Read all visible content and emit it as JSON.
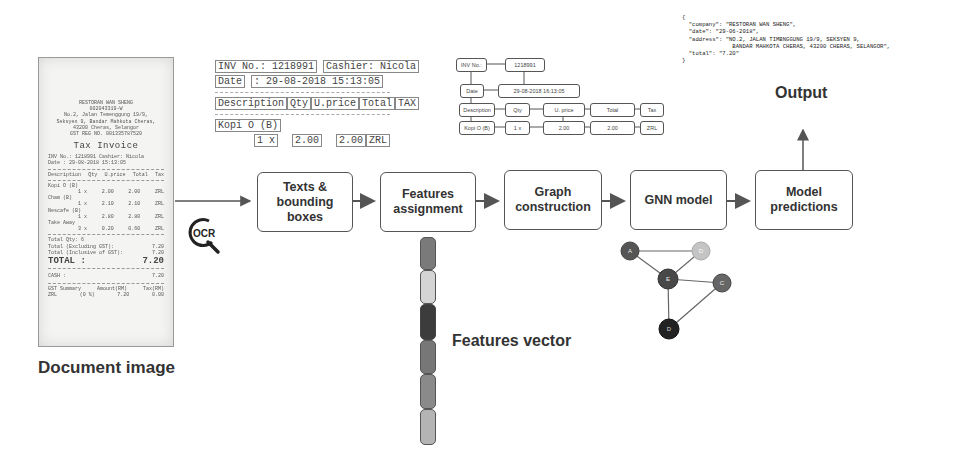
{
  "document": {
    "label": "Document image",
    "receipt": {
      "header_lines": [
        "RESTORAN WAN SHENG",
        "002043319-W",
        "No.2, Jalan Temenggung 19/9,",
        "Seksyen 9, Bandar Mahkota Cheras,",
        "43200 Cheras, Selangor",
        "GST REG NO. 001335787520"
      ],
      "title": "Tax Invoice",
      "inv_line": "INV No.: 1218991   Cashier: Nicola",
      "date_line": "Date   : 29-08-2018 15:13:05",
      "columns": [
        "Description",
        "Qty",
        "U.price",
        "Total",
        "Tax"
      ],
      "items": [
        {
          "name": "Kopi O (B)",
          "qty": "1 x",
          "price": "2.00",
          "total": "2.00",
          "tax": "ZRL"
        },
        {
          "name": "Cham (B)",
          "qty": "1 x",
          "price": "2.10",
          "total": "2.10",
          "tax": "ZRL"
        },
        {
          "name": "Nescafe (B)",
          "qty": "1 x",
          "price": "2.80",
          "total": "2.80",
          "tax": "ZRL"
        },
        {
          "name": "Take Away",
          "qty": "3 x",
          "price": "0.20",
          "total": "0.60",
          "tax": "ZRL"
        }
      ],
      "summary": [
        {
          "label": "Total Qty: 6",
          "value": ""
        },
        {
          "label": "Total (Excluding GST):",
          "value": "7.20"
        },
        {
          "label": "Total (Inclusive of GST):",
          "value": "7.20"
        }
      ],
      "total_label": "TOTAL :",
      "total_value": "7.20",
      "cash_label": "CASH :",
      "cash_value": "7.20",
      "gst_header": [
        "GST Summary",
        "Amount(RM)",
        "Tax(RM)"
      ],
      "gst_row": [
        "ZRL",
        "(0 %)",
        "7.20",
        "0.00"
      ]
    }
  },
  "ocr": {
    "icon_label": "OCR",
    "crop": {
      "inv_no": "INV No.: 1218991",
      "cashier": "Cashier: Nicola",
      "date_label": "Date",
      "date_value": ": 29-08-2018 15:13:05",
      "columns": [
        "Description",
        "Qty",
        "U.price",
        "Total",
        "TAX"
      ],
      "item_name": "Kopi O (B)",
      "item_qty": "1 x",
      "item_price": "2.00",
      "item_total": "2.00",
      "item_tax": "ZRL"
    }
  },
  "graph_diagram": {
    "nodes": {
      "inv_no": "INV No.:",
      "inv_value": "1218991",
      "date": "Date",
      "date_value": "29-08-2018 16:13:05",
      "description": "Description",
      "qty": "Qty",
      "uprice": "U. price",
      "total": "Total",
      "tax": "Tax",
      "item": "Kopi O (B)",
      "item_qty": "1 x",
      "item_price": "2.00",
      "item_total": "2.00",
      "item_tax": "ZRL"
    }
  },
  "output": {
    "label": "Output",
    "json_lines": [
      "{",
      "  \"company\": \"RESTORAN WAN SHENG\",",
      "  \"date\": \"29-06-2018\",",
      "  \"address\": \"NO.2, JALAN TIMBNGGUNG 19/9, SEKSYEN 9,",
      "               BANDAR MAHKOTA CHERAS, 43200 CHERAS, SELANGOR\",",
      "  \"total\": \"7.20\"",
      "}"
    ]
  },
  "pipeline": {
    "steps": [
      {
        "line1": "Texts &",
        "line2": "bounding",
        "line3": "boxes"
      },
      {
        "line1": "Features",
        "line2": "assignment"
      },
      {
        "line1": "Graph",
        "line2": "construction"
      },
      {
        "line1": "GNN model"
      },
      {
        "line1": "Model",
        "line2": "predictions"
      }
    ]
  },
  "features_vector": {
    "label": "Features vector",
    "segments": [
      "#7a7a7a",
      "#d4d4d4",
      "#3c3c3c",
      "#777777",
      "#8a8a8a",
      "#b4b4b4"
    ]
  },
  "gnn_graph": {
    "nodes": [
      {
        "id": "A",
        "color": "#555555"
      },
      {
        "id": "D",
        "color": "#c4c4c4"
      },
      {
        "id": "E",
        "color": "#484848"
      },
      {
        "id": "C",
        "color": "#666666"
      },
      {
        "id": "D",
        "color": "#222222"
      }
    ]
  }
}
